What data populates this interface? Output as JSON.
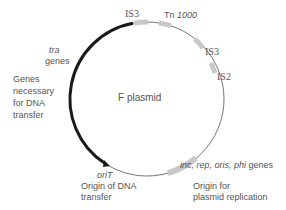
{
  "diagram": {
    "title": "F plasmid",
    "colors": {
      "thick_arc": "#1a1a1a",
      "thin_arc": "#666666",
      "element": "#c8c8c8",
      "text": "#555555"
    },
    "elements": [
      {
        "id": "is3_top",
        "label_prefix": "IS",
        "label_num": "3"
      },
      {
        "id": "tn1000",
        "label_prefix": "Tn ",
        "label_num": "1000"
      },
      {
        "id": "is3_right",
        "label_prefix": "IS",
        "label_num": "3"
      },
      {
        "id": "is2",
        "label_prefix": "IS",
        "label_num": "2"
      }
    ],
    "tra": {
      "gene_name": "tra",
      "gene_word": "genes",
      "description_lines": [
        "Genes",
        "necessary",
        "for DNA",
        "transfer"
      ]
    },
    "oriT": {
      "name": "oriT",
      "description_lines": [
        "Origin of DNA",
        "transfer"
      ]
    },
    "replication": {
      "genes": "inc, rep, oris, phi",
      "gene_word": "genes",
      "description_lines": [
        "Origin for",
        "plasmid replication"
      ]
    }
  }
}
